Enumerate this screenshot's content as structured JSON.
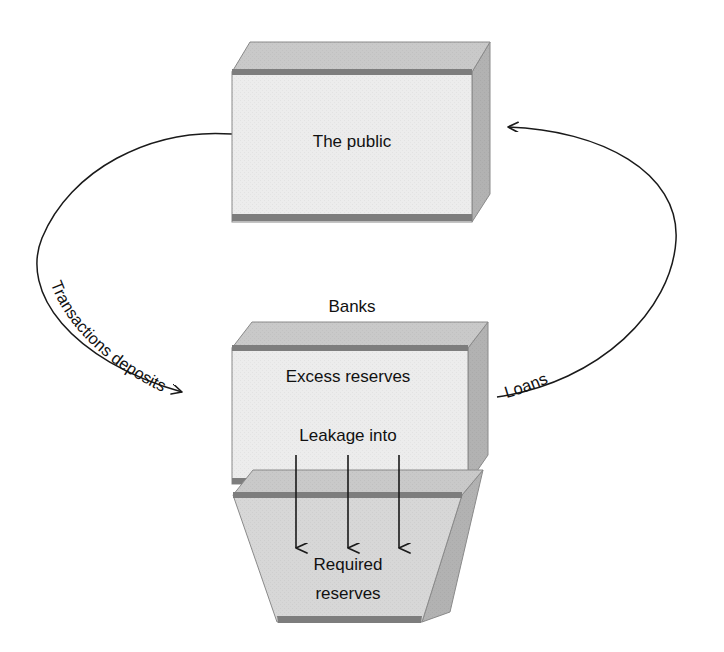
{
  "diagram": {
    "type": "flow-diagram",
    "title_visible": false,
    "background_color": "#ffffff",
    "palette": {
      "front_face": "#e9e9e9",
      "top_face": "#c9c9c9",
      "side_face": "#b4b4b4",
      "dark_bar": "#7a7a7a",
      "outline": "#8c8c8c",
      "text": "#111111",
      "arrow": "#1a1a1a"
    },
    "nodes": [
      {
        "id": "public",
        "label": "The public",
        "shape": "3d-box"
      },
      {
        "id": "banks",
        "label": "Banks",
        "shape": "caption",
        "caption_only": true
      },
      {
        "id": "excess",
        "label": "Excess reserves",
        "shape": "3d-box"
      },
      {
        "id": "leakage",
        "label": "Leakage into",
        "shape": "inline-text"
      },
      {
        "id": "required",
        "label_line1": "Required",
        "label_line2": "reserves",
        "shape": "3d-trapezoid"
      }
    ],
    "edges": [
      {
        "id": "transactions-deposits",
        "label": "Transactions deposits",
        "from": "public",
        "to": "excess",
        "style": "curved-arrow",
        "side": "left",
        "label_curved": true
      },
      {
        "id": "loans",
        "label": "Loans",
        "from": "excess",
        "to": "public",
        "style": "curved-arrow",
        "side": "right",
        "label_curved": true
      },
      {
        "id": "leakage-arrow-1",
        "label": "",
        "from": "excess",
        "to": "required",
        "style": "straight-down-arrow"
      },
      {
        "id": "leakage-arrow-2",
        "label": "",
        "from": "excess",
        "to": "required",
        "style": "straight-down-arrow"
      },
      {
        "id": "leakage-arrow-3",
        "label": "",
        "from": "excess",
        "to": "required",
        "style": "straight-down-arrow"
      }
    ]
  }
}
